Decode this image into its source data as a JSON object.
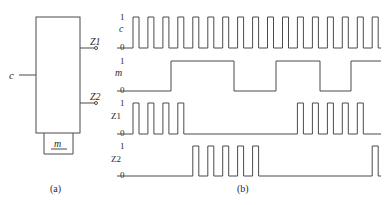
{
  "figure": {
    "panel_a": {
      "caption": "(a)",
      "input_label": "c",
      "outputs": [
        "Z1",
        "Z2"
      ],
      "mode_label": "m"
    },
    "panel_b": {
      "caption": "(b)",
      "signals": [
        {
          "name": "c",
          "high": "1",
          "low": "0"
        },
        {
          "name": "m",
          "high": "1",
          "low": "0"
        },
        {
          "name": "Z1",
          "high": "1",
          "low": "0"
        },
        {
          "name": "Z2",
          "high": "1",
          "low": "0"
        }
      ]
    }
  },
  "waveforms": {
    "x_start": 117,
    "x_end": 381,
    "clock_first_rise": 133,
    "clock_period": 14.95,
    "pulse_width": 6,
    "clock_pulse_count": 17,
    "m_edges": [
      171,
      234,
      276,
      320,
      351
    ],
    "z1_pulse_indices": [
      0,
      1,
      2,
      3,
      11,
      12,
      13,
      14,
      15
    ],
    "z2_pulse_indices": [
      4,
      5,
      6,
      7,
      8,
      16
    ],
    "rows": [
      {
        "key": "c",
        "y_high": 17,
        "y_low": 48
      },
      {
        "key": "m",
        "y_high": 61,
        "y_low": 91
      },
      {
        "key": "Z1",
        "y_high": 103,
        "y_low": 134
      },
      {
        "key": "Z2",
        "y_high": 146,
        "y_low": 176
      }
    ]
  },
  "colors": {
    "line": "#4a4a4a",
    "text": "#2a2a2a"
  }
}
